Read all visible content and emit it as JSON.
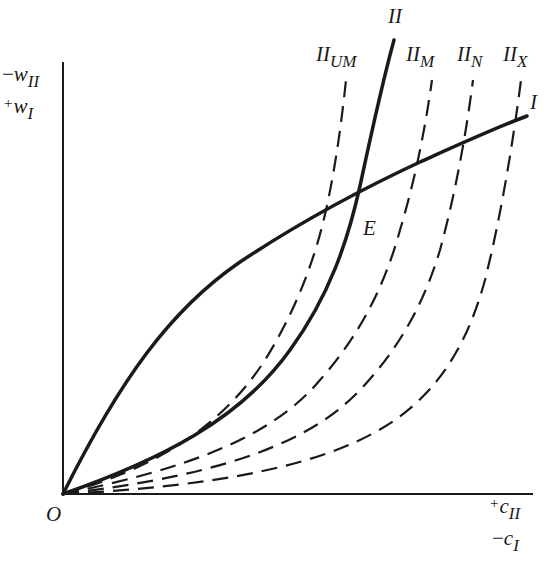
{
  "figure": {
    "type": "economics-diagram",
    "stroke_color": "#1a1a1a",
    "background": "#ffffff"
  },
  "axes": {
    "origin_label": "O",
    "y_axis": {
      "label_line1_sign": "−",
      "label_line1_var": "w",
      "label_line1_sub": "II",
      "label_line2_sign": "+",
      "label_line2_var": "w",
      "label_line2_sub": "I"
    },
    "x_axis": {
      "label_line1_sign": "+",
      "label_line1_var": "c",
      "label_line1_sub": "II",
      "label_line2_sign": "−",
      "label_line2_var": "c",
      "label_line2_sub": "I"
    }
  },
  "curves": {
    "I": {
      "label": "I",
      "style": "solid",
      "shape": "concave"
    },
    "II": {
      "label": "II",
      "style": "solid",
      "shape": "convex"
    },
    "II_UM": {
      "label_main": "II",
      "label_sub": "UM",
      "style": "dashed"
    },
    "II_M": {
      "label_main": "II",
      "label_sub": "M",
      "style": "dashed"
    },
    "II_N": {
      "label_main": "II",
      "label_sub": "N",
      "style": "dashed"
    },
    "II_X": {
      "label_main": "II",
      "label_sub": "X",
      "style": "dashed"
    }
  },
  "points": {
    "E": {
      "label": "E",
      "description": "intersection of curve I and curve II"
    }
  }
}
